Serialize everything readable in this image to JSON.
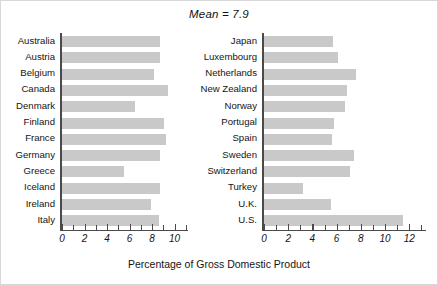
{
  "chart_data": {
    "type": "bar",
    "title": "Mean = 7.9",
    "xlabel": "Percentage of Gross Domestic Product",
    "ylabel": "",
    "orientation": "horizontal",
    "grid": false,
    "legend": null,
    "panels": [
      {
        "name": "left-panel",
        "xlim": [
          0,
          11
        ],
        "xticks_labeled": [
          0,
          2,
          4,
          6,
          8,
          10
        ],
        "xtick_step_minor": 1,
        "categories": [
          "Australia",
          "Austria",
          "Belgium",
          "Canada",
          "Denmark",
          "Finland",
          "France",
          "Germany",
          "Greece",
          "Iceland",
          "Ireland",
          "Italy"
        ],
        "values": [
          8.7,
          8.7,
          8.2,
          9.4,
          6.5,
          9.1,
          9.2,
          8.7,
          5.5,
          8.7,
          7.9,
          8.6
        ]
      },
      {
        "name": "right-panel",
        "xlim": [
          0,
          13.2
        ],
        "xticks_labeled": [
          0,
          2,
          4,
          6,
          8,
          10,
          12
        ],
        "xtick_step_minor": 1,
        "categories": [
          "Japan",
          "Luxembourg",
          "Netherlands",
          "New Zealand",
          "Norway",
          "Portugal",
          "Spain",
          "Sweden",
          "Switzerland",
          "Turkey",
          "U.K.",
          "U.S."
        ],
        "values": [
          5.7,
          6.1,
          7.6,
          6.9,
          6.7,
          5.8,
          5.6,
          7.4,
          7.1,
          3.2,
          5.5,
          11.5
        ]
      }
    ],
    "colors": {
      "bar_fill": "#c9c9c9",
      "axis": "#4a4a4a",
      "text": "#141414",
      "background": "#ffffff"
    }
  }
}
